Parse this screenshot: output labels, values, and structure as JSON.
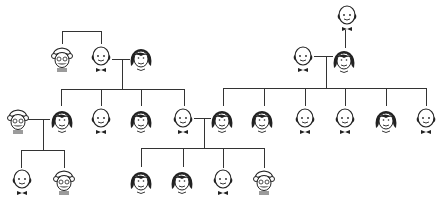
{
  "diagram": {
    "type": "family-tree",
    "line_color": "#333333",
    "people": [
      {
        "id": "p1",
        "kind": "grandmother",
        "x": 62,
        "y": 58,
        "gen": 1
      },
      {
        "id": "p2",
        "kind": "bald-man",
        "x": 101,
        "y": 58,
        "gen": 1
      },
      {
        "id": "p3",
        "kind": "woman",
        "x": 141,
        "y": 58,
        "gen": 1
      },
      {
        "id": "p4",
        "kind": "bald-man",
        "x": 347,
        "y": 17,
        "gen": 0
      },
      {
        "id": "p5",
        "kind": "bald-man",
        "x": 303,
        "y": 58,
        "gen": 1
      },
      {
        "id": "p6",
        "kind": "woman",
        "x": 344,
        "y": 60,
        "gen": 1
      },
      {
        "id": "c1",
        "kind": "grandmother",
        "x": 18,
        "y": 120,
        "gen": 2
      },
      {
        "id": "c2",
        "kind": "woman",
        "x": 62,
        "y": 120,
        "gen": 2
      },
      {
        "id": "c3",
        "kind": "bald-man",
        "x": 101,
        "y": 120,
        "gen": 2
      },
      {
        "id": "c4",
        "kind": "woman",
        "x": 141,
        "y": 120,
        "gen": 2
      },
      {
        "id": "c5",
        "kind": "bald-man",
        "x": 183,
        "y": 120,
        "gen": 2
      },
      {
        "id": "c6",
        "kind": "woman",
        "x": 222,
        "y": 120,
        "gen": 2
      },
      {
        "id": "c7",
        "kind": "woman",
        "x": 262,
        "y": 120,
        "gen": 2
      },
      {
        "id": "c8",
        "kind": "bald-man",
        "x": 305,
        "y": 120,
        "gen": 2
      },
      {
        "id": "c9",
        "kind": "bald-man",
        "x": 345,
        "y": 120,
        "gen": 2
      },
      {
        "id": "c10",
        "kind": "woman",
        "x": 386,
        "y": 120,
        "gen": 2
      },
      {
        "id": "c11",
        "kind": "bald-man",
        "x": 426,
        "y": 120,
        "gen": 2
      },
      {
        "id": "g1",
        "kind": "bald-man",
        "x": 22,
        "y": 181,
        "gen": 3
      },
      {
        "id": "g2",
        "kind": "grandmother",
        "x": 64,
        "y": 181,
        "gen": 3
      },
      {
        "id": "g3",
        "kind": "woman",
        "x": 141,
        "y": 181,
        "gen": 3
      },
      {
        "id": "g4",
        "kind": "woman",
        "x": 182,
        "y": 181,
        "gen": 3
      },
      {
        "id": "g5",
        "kind": "bald-man",
        "x": 223,
        "y": 181,
        "gen": 3
      },
      {
        "id": "g6",
        "kind": "grandmother",
        "x": 264,
        "y": 181,
        "gen": 3
      }
    ],
    "lines": [
      {
        "x1": 62,
        "y1": 31,
        "x2": 101,
        "y2": 31
      },
      {
        "x1": 62,
        "y1": 31,
        "x2": 62,
        "y2": 44
      },
      {
        "x1": 101,
        "y1": 31,
        "x2": 101,
        "y2": 44
      },
      {
        "x1": 112,
        "y1": 59,
        "x2": 130,
        "y2": 59
      },
      {
        "x1": 122,
        "y1": 59,
        "x2": 122,
        "y2": 89
      },
      {
        "x1": 61,
        "y1": 89,
        "x2": 184,
        "y2": 89
      },
      {
        "x1": 61,
        "y1": 89,
        "x2": 61,
        "y2": 106
      },
      {
        "x1": 101,
        "y1": 89,
        "x2": 101,
        "y2": 106
      },
      {
        "x1": 141,
        "y1": 89,
        "x2": 141,
        "y2": 106
      },
      {
        "x1": 184,
        "y1": 89,
        "x2": 184,
        "y2": 106
      },
      {
        "x1": 345,
        "y1": 30,
        "x2": 345,
        "y2": 48
      },
      {
        "x1": 314,
        "y1": 56,
        "x2": 333,
        "y2": 56
      },
      {
        "x1": 326,
        "y1": 56,
        "x2": 326,
        "y2": 88
      },
      {
        "x1": 223,
        "y1": 88,
        "x2": 426,
        "y2": 88
      },
      {
        "x1": 223,
        "y1": 88,
        "x2": 223,
        "y2": 106
      },
      {
        "x1": 264,
        "y1": 88,
        "x2": 264,
        "y2": 106
      },
      {
        "x1": 305,
        "y1": 88,
        "x2": 305,
        "y2": 106
      },
      {
        "x1": 345,
        "y1": 88,
        "x2": 345,
        "y2": 106
      },
      {
        "x1": 386,
        "y1": 88,
        "x2": 386,
        "y2": 106
      },
      {
        "x1": 426,
        "y1": 88,
        "x2": 426,
        "y2": 106
      },
      {
        "x1": 28,
        "y1": 119,
        "x2": 50,
        "y2": 119
      },
      {
        "x1": 43,
        "y1": 119,
        "x2": 43,
        "y2": 150
      },
      {
        "x1": 21,
        "y1": 150,
        "x2": 64,
        "y2": 150
      },
      {
        "x1": 21,
        "y1": 150,
        "x2": 21,
        "y2": 168
      },
      {
        "x1": 64,
        "y1": 150,
        "x2": 64,
        "y2": 168
      },
      {
        "x1": 194,
        "y1": 118,
        "x2": 211,
        "y2": 118
      },
      {
        "x1": 204,
        "y1": 118,
        "x2": 204,
        "y2": 148
      },
      {
        "x1": 141,
        "y1": 148,
        "x2": 264,
        "y2": 148
      },
      {
        "x1": 141,
        "y1": 148,
        "x2": 141,
        "y2": 167
      },
      {
        "x1": 183,
        "y1": 148,
        "x2": 183,
        "y2": 167
      },
      {
        "x1": 223,
        "y1": 148,
        "x2": 223,
        "y2": 168
      },
      {
        "x1": 264,
        "y1": 148,
        "x2": 264,
        "y2": 168
      }
    ]
  }
}
